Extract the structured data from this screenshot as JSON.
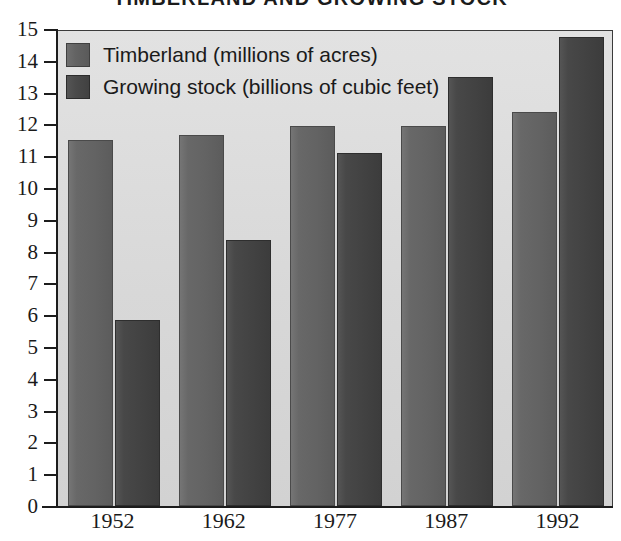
{
  "chart_data": {
    "type": "bar",
    "title": "TIMBERLAND AND GROWING STOCK",
    "xlabel": "",
    "ylabel": "",
    "categories": [
      "1952",
      "1962",
      "1977",
      "1987",
      "1992"
    ],
    "series": [
      {
        "name": "Timberland (millions of acres)",
        "values": [
          11.5,
          11.67,
          11.95,
          11.95,
          12.4
        ],
        "color": "#636363"
      },
      {
        "name": "Growing stock (billions of cubic feet)",
        "values": [
          5.85,
          8.35,
          11.1,
          13.5,
          14.75
        ],
        "color": "#454545"
      }
    ],
    "ylim": [
      0,
      15
    ],
    "ytick_step": 1,
    "yticks": [
      "0",
      "1",
      "2",
      "3",
      "4",
      "5",
      "6",
      "7",
      "8",
      "9",
      "10",
      "11",
      "12",
      "13",
      "14",
      "15"
    ],
    "grid": false,
    "legend_position": "top-left",
    "plot_background": "#dcdcdc"
  },
  "legend": {
    "entries": [
      {
        "label": "Timberland (millions of acres)",
        "swatch": "series-0-swatch"
      },
      {
        "label": "Growing stock (billions of cubic feet)",
        "swatch": "series-1-swatch"
      }
    ]
  }
}
